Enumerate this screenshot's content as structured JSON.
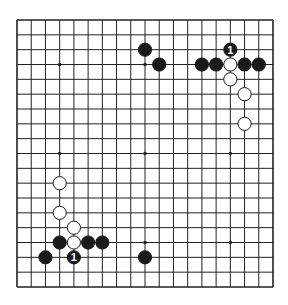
{
  "diagram": {
    "type": "go-board",
    "size": 19,
    "colors": {
      "line": "#222222",
      "black": "#1a1a1a",
      "white": "#ffffff",
      "background": "#ffffff"
    },
    "star_points": [
      [
        3,
        3
      ],
      [
        9,
        3
      ],
      [
        15,
        3
      ],
      [
        3,
        9
      ],
      [
        9,
        9
      ],
      [
        15,
        9
      ],
      [
        3,
        15
      ],
      [
        9,
        15
      ],
      [
        15,
        15
      ]
    ],
    "stones": [
      {
        "color": "black",
        "col": 9,
        "row": 2
      },
      {
        "color": "black",
        "col": 10,
        "row": 3
      },
      {
        "color": "black",
        "col": 15,
        "row": 2,
        "label": "1"
      },
      {
        "color": "black",
        "col": 13,
        "row": 3
      },
      {
        "color": "black",
        "col": 14,
        "row": 3
      },
      {
        "color": "white",
        "col": 15,
        "row": 3
      },
      {
        "color": "black",
        "col": 16,
        "row": 3
      },
      {
        "color": "black",
        "col": 17,
        "row": 3
      },
      {
        "color": "white",
        "col": 15,
        "row": 4
      },
      {
        "color": "white",
        "col": 16,
        "row": 5
      },
      {
        "color": "white",
        "col": 16,
        "row": 7
      },
      {
        "color": "white",
        "col": 3,
        "row": 11
      },
      {
        "color": "white",
        "col": 3,
        "row": 13
      },
      {
        "color": "white",
        "col": 4,
        "row": 14
      },
      {
        "color": "black",
        "col": 3,
        "row": 15
      },
      {
        "color": "white",
        "col": 4,
        "row": 15
      },
      {
        "color": "black",
        "col": 5,
        "row": 15
      },
      {
        "color": "black",
        "col": 6,
        "row": 15
      },
      {
        "color": "black",
        "col": 2,
        "row": 16
      },
      {
        "color": "black",
        "col": 4,
        "row": 16,
        "label": "1"
      },
      {
        "color": "black",
        "col": 9,
        "row": 16
      }
    ]
  }
}
